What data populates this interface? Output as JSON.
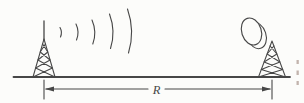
{
  "figure": {
    "name": "radio-link-distance-diagram",
    "distance_label": "R",
    "wave_count": 5,
    "colors": {
      "background": "#fcfcfa",
      "line": "#474747",
      "fragment": "#c2b4ad"
    },
    "elements": {
      "transmitter": "lattice tower with vertical mast antenna radiating waves",
      "receiver": "lattice tower with drum antenna",
      "ground": "horizontal ground line",
      "dimension": "double-headed arrow between towers labeled R"
    }
  }
}
